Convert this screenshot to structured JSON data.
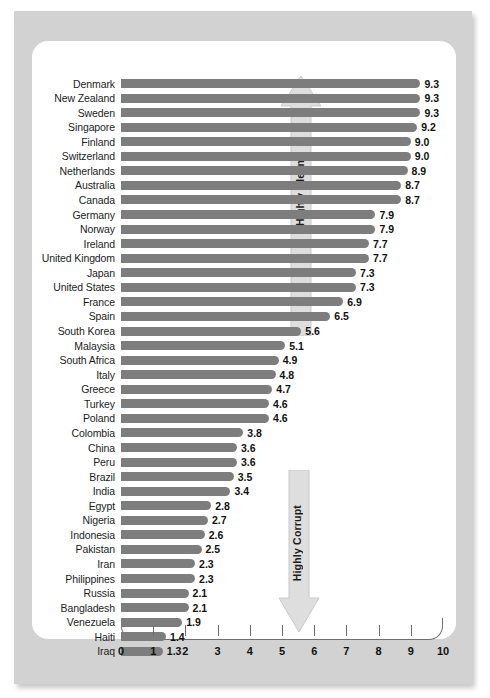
{
  "figure": {
    "frame_color": "#d2d2d2",
    "panel_color": "#ffffff",
    "bar_color": "#7d7d7d",
    "axis_color": "#6f6f6f",
    "arrow_color": "#dcdcdc"
  },
  "annotations": {
    "top_arrow_label": "Highly Clean",
    "bottom_arrow_label": "Highly Corrupt"
  },
  "chart_data": {
    "type": "bar",
    "orientation": "horizontal",
    "title": "",
    "subtitle": "",
    "xlabel": "",
    "ylabel": "",
    "xlim": [
      0,
      10
    ],
    "grid": false,
    "legend": null,
    "tick_labels": [
      "0",
      "1",
      "2",
      "3",
      "4",
      "5",
      "6",
      "7",
      "8",
      "9",
      "10"
    ],
    "ticks": [
      0,
      1,
      2,
      3,
      4,
      5,
      6,
      7,
      8,
      9,
      10
    ],
    "annotations": [
      "Highly Clean",
      "Highly Corrupt"
    ],
    "categories": [
      "Denmark",
      "New Zealand",
      "Sweden",
      "Singapore",
      "Finland",
      "Switzerland",
      "Netherlands",
      "Australia",
      "Canada",
      "Germany",
      "Norway",
      "Ireland",
      "United Kingdom",
      "Japan",
      "United States",
      "France",
      "Spain",
      "South Korea",
      "Malaysia",
      "South Africa",
      "Italy",
      "Greece",
      "Turkey",
      "Poland",
      "Colombia",
      "China",
      "Peru",
      "Brazil",
      "India",
      "Egypt",
      "Nigeria",
      "Indonesia",
      "Pakistan",
      "Iran",
      "Philippines",
      "Russia",
      "Bangladesh",
      "Venezuela",
      "Haiti",
      "Iraq"
    ],
    "values": [
      9.3,
      9.3,
      9.3,
      9.2,
      9.0,
      9.0,
      8.9,
      8.7,
      8.7,
      7.9,
      7.9,
      7.7,
      7.7,
      7.3,
      7.3,
      6.9,
      6.5,
      5.6,
      5.1,
      4.9,
      4.8,
      4.7,
      4.6,
      4.6,
      3.8,
      3.6,
      3.6,
      3.5,
      3.4,
      2.8,
      2.7,
      2.6,
      2.5,
      2.3,
      2.3,
      2.1,
      2.1,
      1.9,
      1.4,
      1.3
    ],
    "value_labels": [
      "9.3",
      "9.3",
      "9.3",
      "9.2",
      "9.0",
      "9.0",
      "8.9",
      "8.7",
      "8.7",
      "7.9",
      "7.9",
      "7.7",
      "7.7",
      "7.3",
      "7.3",
      "6.9",
      "6.5",
      "5.6",
      "5.1",
      "4.9",
      "4.8",
      "4.7",
      "4.6",
      "4.6",
      "3.8",
      "3.6",
      "3.6",
      "3.5",
      "3.4",
      "2.8",
      "2.7",
      "2.6",
      "2.5",
      "2.3",
      "2.3",
      "2.1",
      "2.1",
      "1.9",
      "1.4",
      "1.3"
    ]
  }
}
